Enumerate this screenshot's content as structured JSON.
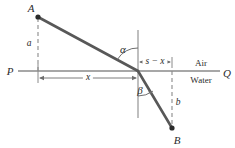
{
  "figure": {
    "colors": {
      "ray": "#585858",
      "axis": "#8a8a8a",
      "normal": "#8a8a8a",
      "dashed": "#8a8a8a",
      "dimension": "#6e6e6e",
      "text": "#2b2b2b",
      "background": "#ffffff"
    },
    "points": [
      {
        "name": "point-a",
        "label": "A",
        "x": 38,
        "y": 17,
        "label_x": 31,
        "label_y": 8
      },
      {
        "name": "point-b",
        "label": "B",
        "x": 172,
        "y": 128,
        "label_x": 177,
        "label_y": 140
      }
    ],
    "interface_point": {
      "x": 138,
      "y": 71
    },
    "endpoints": {
      "left_label": "P",
      "left_label_x": 10,
      "left_label_y": 71,
      "right_label": "Q",
      "right_label_x": 227,
      "right_label_y": 73
    },
    "angles": [
      {
        "name": "angle-alpha",
        "label": "α",
        "x": 123,
        "y": 49
      },
      {
        "name": "angle-beta",
        "label": "β",
        "x": 140,
        "y": 90
      }
    ],
    "dimensions": [
      {
        "name": "dimension-a",
        "label": "a",
        "x": 29,
        "y": 44
      },
      {
        "name": "dimension-b",
        "label": "b",
        "x": 178,
        "y": 103
      },
      {
        "name": "dimension-x",
        "label": "x",
        "x": 88,
        "y": 78
      },
      {
        "name": "dimension-s-minus-x",
        "label": "s − x",
        "x": 155,
        "y": 62
      }
    ],
    "media": [
      {
        "name": "medium-air",
        "label": "Air",
        "x": 201,
        "y": 63
      },
      {
        "name": "medium-water",
        "label": "Water",
        "x": 201,
        "y": 80
      }
    ]
  }
}
